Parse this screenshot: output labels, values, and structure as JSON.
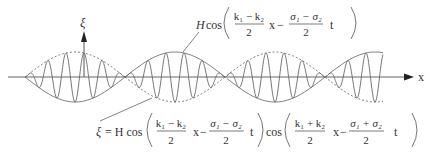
{
  "diagram": {
    "axes": {
      "x_label": "x",
      "y_label": "ξ"
    },
    "labels": {
      "envelope": {
        "H": "H",
        "cos": "cos",
        "num1": "k₁ − k₂",
        "den1": "2",
        "x": "x",
        "minus": "−",
        "num2": "σ₁ − σ₂",
        "den2": "2",
        "t": "t"
      },
      "wave": {
        "xi": "ξ",
        "eq": "= H cos",
        "num1": "k₁ − k₂",
        "den1": "2",
        "x1": "x",
        "minus1": "−",
        "num2": "σ₁ − σ₂",
        "den2": "2",
        "t1": "t",
        "cos2": "cos",
        "num3": "k₁ + k₂",
        "den3": "2",
        "x2": "x",
        "minus2": "−",
        "num4": "σ₁ + σ₂",
        "den4": "2",
        "t2": "t"
      }
    },
    "geometry": {
      "axis_y": 77,
      "amplitude": 25,
      "nodes_x": [
        25,
        125,
        227,
        328
      ],
      "wave_start_x": 25,
      "wave_end_x": 383,
      "carrier_cycles_per_group": 5.5
    }
  }
}
